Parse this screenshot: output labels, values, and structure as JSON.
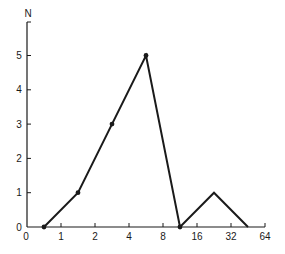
{
  "chart_data": {
    "type": "line",
    "title": "",
    "xlabel": "",
    "ylabel": "N",
    "x_tick_labels": [
      "0",
      "1",
      "2",
      "4",
      "8",
      "16",
      "32",
      "64"
    ],
    "y_tick_labels": [
      "0",
      "1",
      "2",
      "3",
      "4",
      "5"
    ],
    "categories": [
      "0-1",
      "1-2",
      "2-4",
      "4-8",
      "8-16",
      "16-32",
      "32-64"
    ],
    "values": [
      0,
      1,
      3,
      5,
      0,
      1,
      0
    ],
    "ylim": [
      0,
      5.9
    ],
    "x_scale": "log2 bins",
    "grid": false,
    "legend": null,
    "markers": [
      true,
      true,
      true,
      true,
      true,
      false,
      false
    ],
    "color": "#1a1a1a"
  }
}
